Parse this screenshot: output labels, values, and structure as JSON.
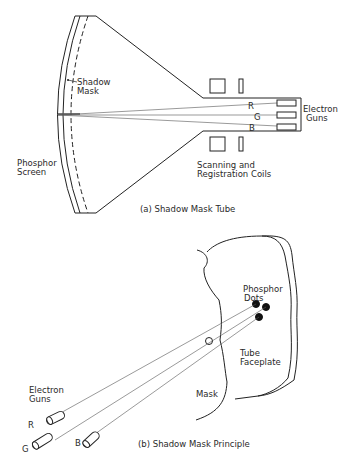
{
  "figure_a": {
    "caption": "(a)  Shadow Mask Tube",
    "labels": {
      "shadow_mask_1": "Shadow",
      "shadow_mask_2": "Mask",
      "phosphor_screen_1": "Phosphor",
      "phosphor_screen_2": "Screen",
      "electron_guns_1": "Electron",
      "electron_guns_2": "Guns",
      "coils_1": "Scanning and",
      "coils_2": "Registration Coils",
      "gun_r": "R",
      "gun_g": "G",
      "gun_b": "B"
    }
  },
  "figure_b": {
    "caption": "(b)  Shadow Mask Principle",
    "labels": {
      "phosphor_dots_1": "Phosphor",
      "phosphor_dots_2": "Dots",
      "tube_faceplate_1": "Tube",
      "tube_faceplate_2": "Faceplate",
      "mask": "Mask",
      "electron_guns_1": "Electron",
      "electron_guns_2": "Guns",
      "gun_r": "R",
      "gun_g": "G",
      "gun_b": "B"
    }
  },
  "colors": {
    "ink": "#222222",
    "background": "#ffffff"
  }
}
